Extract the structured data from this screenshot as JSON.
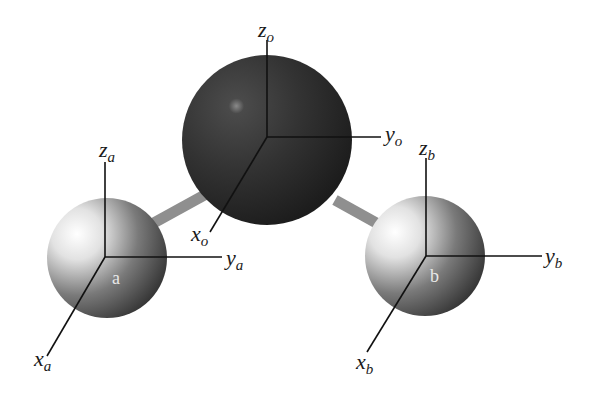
{
  "figure": {
    "atoms": [
      {
        "id": "o",
        "label": "",
        "color": "#2b2b2b",
        "cx": 267,
        "cy": 140,
        "r": 85
      },
      {
        "id": "a",
        "label": "a",
        "color": "#b0b0b0",
        "cx": 107,
        "cy": 258,
        "r": 60
      },
      {
        "id": "b",
        "label": "b",
        "color": "#b0b0b0",
        "cx": 425,
        "cy": 256,
        "r": 60
      }
    ],
    "bonds": [
      {
        "from": "o",
        "to": "a"
      },
      {
        "from": "o",
        "to": "b"
      }
    ],
    "axes": {
      "o": {
        "z": {
          "base": "z",
          "sub": "o"
        },
        "y": {
          "base": "y",
          "sub": "o"
        },
        "x": {
          "base": "x",
          "sub": "o"
        }
      },
      "a": {
        "z": {
          "base": "z",
          "sub": "a"
        },
        "y": {
          "base": "y",
          "sub": "a"
        },
        "x": {
          "base": "x",
          "sub": "a"
        }
      },
      "b": {
        "z": {
          "base": "z",
          "sub": "b"
        },
        "y": {
          "base": "y",
          "sub": "b"
        },
        "x": {
          "base": "x",
          "sub": "b"
        }
      }
    },
    "colors": {
      "axis_line": "#111111",
      "bond": "#8a8a8a",
      "background": "#ffffff"
    }
  }
}
